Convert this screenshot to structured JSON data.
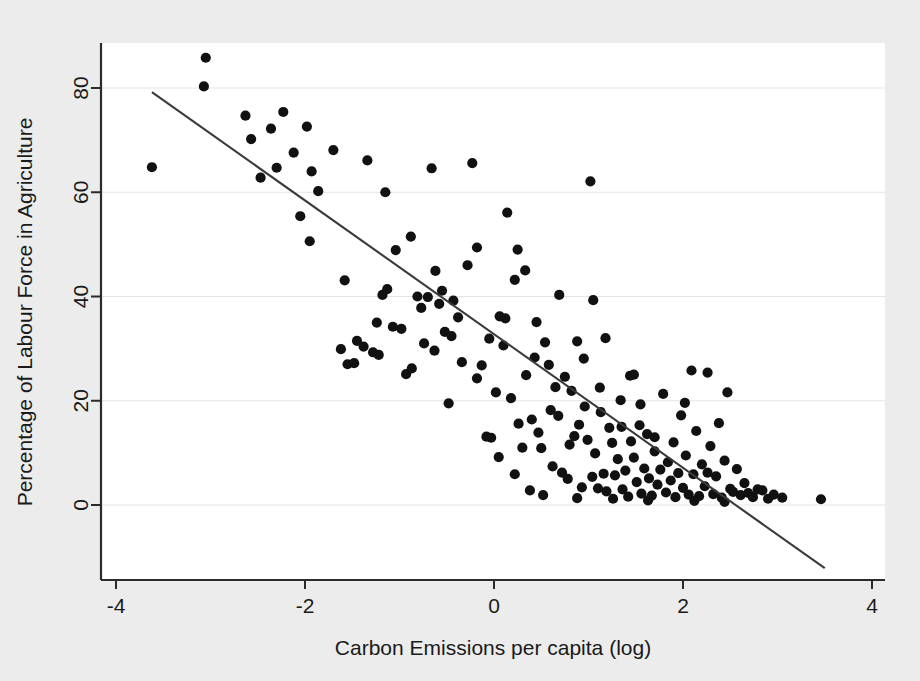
{
  "figure": {
    "background_color": "#ececec",
    "plot_background_color": "#ffffff",
    "point_color": "#111111",
    "line_color": "#3a3a3a",
    "axis_color": "#2b2b2b",
    "gridline_color": "#e4e4e4"
  },
  "chart_data": {
    "type": "scatter",
    "title": "",
    "xlabel": "Carbon Emissions per capita (log)",
    "ylabel": "Percentage of Labour Force in Agriculture",
    "xlim": [
      -4.15,
      4.15
    ],
    "ylim": [
      -13,
      90
    ],
    "xticks": [
      -4,
      -2,
      0,
      2,
      4
    ],
    "xtick_labels": [
      "-4",
      "-2",
      "0",
      "2",
      "4"
    ],
    "yticks": [
      0,
      20,
      40,
      60,
      80
    ],
    "ytick_labels": [
      "0",
      "20",
      "40",
      "60",
      "80"
    ],
    "grid": "horizontal-faint",
    "legend": "none",
    "marker": "filled-circle",
    "marker_size": 9,
    "fit_line": {
      "label": "linear fit",
      "x_start": -3.62,
      "y_start": 79.2,
      "x_end": 3.5,
      "y_end": -12.1
    },
    "series": [
      {
        "name": "Countries",
        "points": [
          [
            -3.62,
            64.8
          ],
          [
            -3.05,
            85.8
          ],
          [
            -3.07,
            80.3
          ],
          [
            -2.63,
            74.7
          ],
          [
            -2.57,
            70.2
          ],
          [
            -2.47,
            62.8
          ],
          [
            -2.36,
            72.2
          ],
          [
            -2.23,
            75.4
          ],
          [
            -2.12,
            67.6
          ],
          [
            -2.05,
            55.4
          ],
          [
            -1.98,
            72.6
          ],
          [
            -1.93,
            64.0
          ],
          [
            -1.86,
            60.2
          ],
          [
            -1.7,
            68.1
          ],
          [
            -1.58,
            43.1
          ],
          [
            -1.55,
            27.0
          ],
          [
            -1.48,
            27.2
          ],
          [
            -1.45,
            31.5
          ],
          [
            -1.38,
            30.4
          ],
          [
            -1.34,
            66.1
          ],
          [
            -1.28,
            29.3
          ],
          [
            -1.22,
            28.8
          ],
          [
            -1.13,
            41.4
          ],
          [
            -1.07,
            34.2
          ],
          [
            -1.04,
            48.9
          ],
          [
            -0.98,
            33.8
          ],
          [
            -0.93,
            25.1
          ],
          [
            -0.88,
            51.5
          ],
          [
            -0.81,
            40.0
          ],
          [
            -0.77,
            37.8
          ],
          [
            -0.74,
            31.0
          ],
          [
            -0.7,
            39.9
          ],
          [
            -0.66,
            64.6
          ],
          [
            -0.63,
            29.6
          ],
          [
            -0.58,
            38.6
          ],
          [
            -0.52,
            33.2
          ],
          [
            -0.48,
            19.5
          ],
          [
            -0.43,
            39.2
          ],
          [
            -0.38,
            36.0
          ],
          [
            -0.34,
            27.4
          ],
          [
            -0.28,
            46.0
          ],
          [
            -0.23,
            65.6
          ],
          [
            -0.18,
            49.4
          ],
          [
            -0.13,
            26.8
          ],
          [
            -0.08,
            13.1
          ],
          [
            -0.03,
            12.9
          ],
          [
            0.02,
            21.6
          ],
          [
            0.06,
            36.2
          ],
          [
            0.1,
            30.6
          ],
          [
            0.14,
            56.1
          ],
          [
            0.18,
            20.5
          ],
          [
            0.22,
            43.2
          ],
          [
            0.26,
            15.6
          ],
          [
            0.3,
            11.0
          ],
          [
            0.34,
            24.9
          ],
          [
            0.38,
            2.8
          ],
          [
            0.43,
            28.3
          ],
          [
            0.47,
            13.9
          ],
          [
            0.5,
            10.9
          ],
          [
            0.54,
            31.2
          ],
          [
            0.58,
            26.9
          ],
          [
            0.62,
            7.4
          ],
          [
            0.65,
            22.6
          ],
          [
            0.68,
            17.1
          ],
          [
            0.72,
            6.2
          ],
          [
            0.75,
            24.6
          ],
          [
            0.78,
            5.0
          ],
          [
            0.82,
            21.9
          ],
          [
            0.85,
            13.2
          ],
          [
            0.88,
            31.4
          ],
          [
            0.9,
            15.4
          ],
          [
            0.93,
            3.4
          ],
          [
            0.96,
            18.9
          ],
          [
            0.99,
            12.5
          ],
          [
            1.02,
            62.1
          ],
          [
            1.04,
            5.4
          ],
          [
            1.07,
            9.9
          ],
          [
            1.1,
            3.2
          ],
          [
            1.13,
            17.8
          ],
          [
            1.16,
            6.0
          ],
          [
            1.19,
            2.6
          ],
          [
            1.22,
            14.8
          ],
          [
            1.25,
            11.9
          ],
          [
            1.28,
            5.7
          ],
          [
            1.31,
            8.8
          ],
          [
            1.34,
            20.1
          ],
          [
            1.36,
            3.0
          ],
          [
            1.39,
            6.6
          ],
          [
            1.42,
            1.6
          ],
          [
            1.45,
            12.2
          ],
          [
            1.48,
            9.1
          ],
          [
            1.51,
            4.4
          ],
          [
            1.54,
            15.3
          ],
          [
            1.56,
            2.2
          ],
          [
            1.59,
            7.0
          ],
          [
            1.62,
            13.6
          ],
          [
            1.64,
            5.1
          ],
          [
            1.67,
            1.8
          ],
          [
            1.7,
            10.3
          ],
          [
            1.73,
            3.9
          ],
          [
            1.76,
            6.8
          ],
          [
            1.79,
            21.3
          ],
          [
            1.82,
            2.4
          ],
          [
            1.84,
            8.2
          ],
          [
            1.87,
            4.7
          ],
          [
            1.9,
            12.0
          ],
          [
            1.92,
            1.5
          ],
          [
            1.95,
            6.1
          ],
          [
            1.98,
            17.2
          ],
          [
            2.0,
            3.3
          ],
          [
            2.03,
            9.5
          ],
          [
            2.06,
            2.0
          ],
          [
            2.09,
            25.8
          ],
          [
            2.11,
            5.9
          ],
          [
            2.14,
            14.2
          ],
          [
            2.17,
            1.7
          ],
          [
            2.2,
            7.8
          ],
          [
            2.23,
            3.6
          ],
          [
            2.26,
            25.4
          ],
          [
            2.29,
            11.3
          ],
          [
            2.32,
            2.1
          ],
          [
            2.35,
            5.5
          ],
          [
            2.38,
            15.7
          ],
          [
            2.41,
            1.4
          ],
          [
            2.44,
            8.5
          ],
          [
            2.47,
            21.6
          ],
          [
            2.5,
            3.1
          ],
          [
            2.53,
            2.5
          ],
          [
            2.57,
            6.9
          ],
          [
            2.61,
            1.9
          ],
          [
            2.65,
            4.2
          ],
          [
            2.69,
            2.3
          ],
          [
            2.74,
            1.5
          ],
          [
            2.79,
            3.0
          ],
          [
            2.84,
            2.8
          ],
          [
            2.9,
            1.2
          ],
          [
            2.96,
            2.0
          ],
          [
            3.05,
            1.4
          ],
          [
            3.46,
            1.1
          ],
          [
            -0.55,
            41.1
          ],
          [
            -0.45,
            32.4
          ],
          [
            0.12,
            35.8
          ],
          [
            0.45,
            35.1
          ],
          [
            0.69,
            40.3
          ],
          [
            1.05,
            39.3
          ],
          [
            1.18,
            32.0
          ],
          [
            0.33,
            45.0
          ],
          [
            0.25,
            49.0
          ],
          [
            -0.62,
            44.9
          ],
          [
            -1.18,
            40.3
          ],
          [
            -0.87,
            26.2
          ],
          [
            -1.24,
            35.0
          ],
          [
            0.8,
            11.6
          ],
          [
            1.12,
            22.5
          ],
          [
            1.35,
            15.0
          ],
          [
            1.55,
            19.3
          ],
          [
            0.95,
            28.1
          ],
          [
            2.02,
            19.6
          ],
          [
            2.26,
            6.2
          ],
          [
            -1.62,
            29.9
          ],
          [
            -0.18,
            24.3
          ],
          [
            0.05,
            9.2
          ],
          [
            0.6,
            18.2
          ],
          [
            1.44,
            24.8
          ],
          [
            1.7,
            13.0
          ],
          [
            -2.3,
            64.7
          ],
          [
            -1.95,
            50.6
          ],
          [
            -1.15,
            60.0
          ],
          [
            0.22,
            5.9
          ],
          [
            0.52,
            1.9
          ],
          [
            0.88,
            1.3
          ],
          [
            1.26,
            1.2
          ],
          [
            1.63,
            0.9
          ],
          [
            2.12,
            0.8
          ],
          [
            2.44,
            0.6
          ],
          [
            -0.05,
            31.9
          ],
          [
            0.4,
            16.4
          ],
          [
            1.48,
            25.0
          ]
        ]
      }
    ]
  }
}
